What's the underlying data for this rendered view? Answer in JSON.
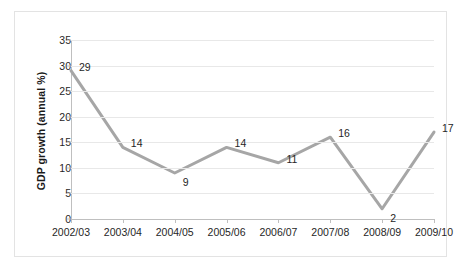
{
  "chart_data": {
    "type": "line",
    "title": "",
    "xlabel": "",
    "ylabel": "GDP growth (annual %)",
    "categories": [
      "2002/03",
      "2003/04",
      "2004/05",
      "2005/06",
      "2006/07",
      "2007/08",
      "2008/09",
      "2009/10"
    ],
    "values": [
      29,
      14,
      9,
      14,
      11,
      16,
      2,
      17
    ],
    "point_labels": [
      "29",
      "14",
      "9",
      "14",
      "11",
      "16",
      "2",
      "17"
    ],
    "ylim": [
      0,
      35
    ],
    "ytick_values": [
      0,
      5,
      10,
      15,
      20,
      25,
      30,
      35
    ],
    "ytick_labels": [
      "0",
      "5",
      "10",
      "15",
      "20",
      "25",
      "30",
      "35"
    ],
    "grid": true,
    "legend": false,
    "legend_position": "none",
    "series_color": "#a6a6a6",
    "gridline_color": "#e8e8e8",
    "axis_color": "#bfbfbf",
    "border_color": "#e3e3e3",
    "background_color": "#ffffff",
    "text_color": "#262626"
  }
}
